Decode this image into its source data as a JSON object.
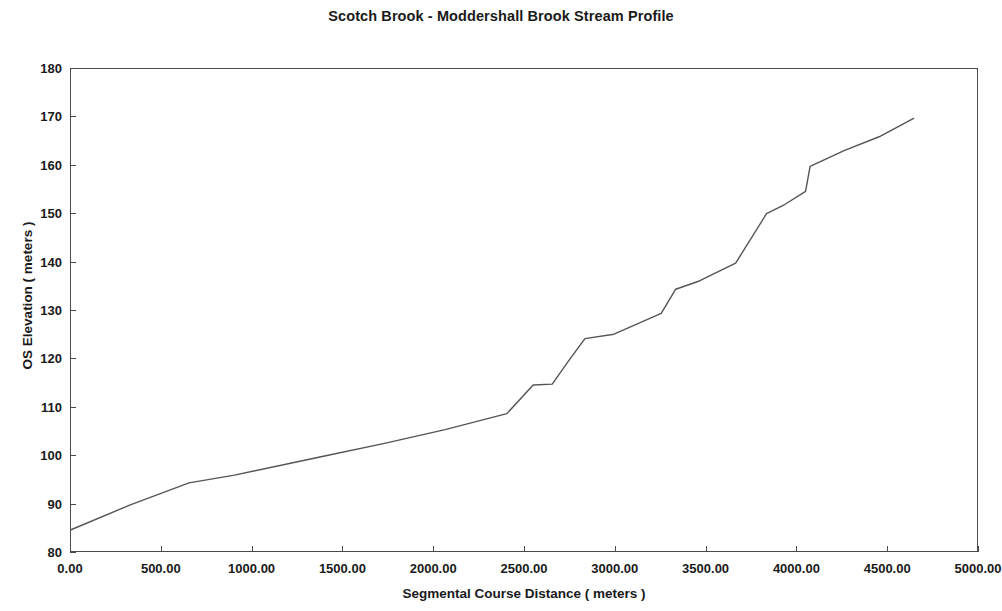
{
  "chart_data": {
    "type": "line",
    "title": "Scotch Brook - Moddershall Brook Stream Profile",
    "xlabel": "Segmental Course Distance ( meters )",
    "ylabel": "OS Elevation ( meters )",
    "xlim": [
      0,
      5000
    ],
    "ylim": [
      80,
      180
    ],
    "xticks": [
      0,
      500,
      1000,
      1500,
      2000,
      2500,
      3000,
      3500,
      4000,
      4500,
      5000
    ],
    "xtick_labels": [
      "0.00",
      "500.00",
      "1000.00",
      "1500.00",
      "2000.00",
      "2500.00",
      "3000.00",
      "3500.00",
      "4000.00",
      "4500.00",
      "5000.00"
    ],
    "yticks": [
      80,
      90,
      100,
      110,
      120,
      130,
      140,
      150,
      160,
      170,
      180
    ],
    "ytick_labels": [
      "80",
      "90",
      "100",
      "110",
      "120",
      "130",
      "140",
      "150",
      "160",
      "170",
      "180"
    ],
    "grid": false,
    "legend": false,
    "line_color": "#555555",
    "line_width": 1.4,
    "series": [
      {
        "name": "Stream profile",
        "x": [
          0,
          330,
          650,
          900,
          1390,
          1720,
          2060,
          2400,
          2545,
          2650,
          2740,
          2830,
          2990,
          3250,
          3330,
          3460,
          3660,
          3830,
          3930,
          4045,
          4070,
          4260,
          4450,
          4640
        ],
        "y": [
          84.8,
          90.0,
          94.5,
          96.1,
          100.0,
          102.6,
          105.5,
          108.8,
          114.7,
          114.9,
          119.7,
          124.3,
          125.2,
          129.5,
          134.5,
          136.2,
          139.9,
          150.1,
          152.0,
          154.7,
          159.9,
          163.2,
          166.0,
          169.8
        ]
      }
    ]
  }
}
